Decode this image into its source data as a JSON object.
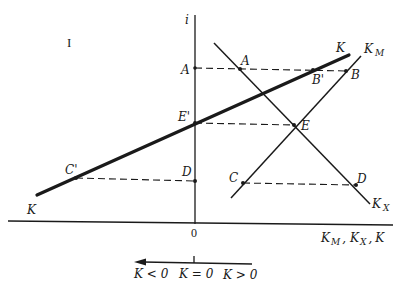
{
  "diagram": {
    "region_label": "I",
    "axes": {
      "y_label": "i",
      "x_label": {
        "K_M": {
          "base": "K",
          "sub": "M"
        },
        "sep1": ",",
        "K_X": {
          "base": "K",
          "sub": "X"
        },
        "sep2": ",",
        "K": "K"
      },
      "origin": "0"
    },
    "curves": {
      "K": {
        "label": "K",
        "label_end": "K"
      },
      "K_M": {
        "base": "K",
        "sub": "M"
      },
      "K_X": {
        "base": "K",
        "sub": "X"
      }
    },
    "points": {
      "A_axis": "A",
      "A": "A",
      "B_prime": "B'",
      "B": "B",
      "E_prime": "E'",
      "E": "E",
      "C_prime": "C'",
      "D_axis": "D",
      "C": "C",
      "D": "D"
    },
    "legend": {
      "neg": "K < 0",
      "zero": "K = 0",
      "pos": "K > 0"
    },
    "colors": {
      "ink": "#1a1a1a",
      "background": "#ffffff"
    }
  }
}
